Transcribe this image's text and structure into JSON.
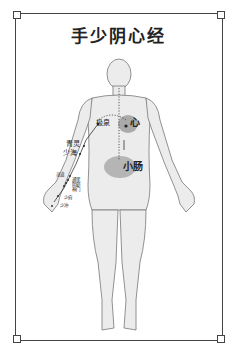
{
  "title": "手少阴心经",
  "figure": {
    "colors": {
      "skin": "#ececec",
      "outline": "#777777",
      "organ": "#9a9a9a",
      "meridian": "#333333"
    }
  },
  "organs": {
    "heart": "心",
    "small_intestine": "小肠"
  },
  "points": {
    "jiquan": "极泉",
    "qingling": "青灵",
    "shaohai": "少海",
    "lingdao": "灵道",
    "tongli": "通里",
    "yinxi": "阴郄",
    "shenmen": "神门",
    "shaofu": "少府",
    "shaochong": "少冲"
  }
}
